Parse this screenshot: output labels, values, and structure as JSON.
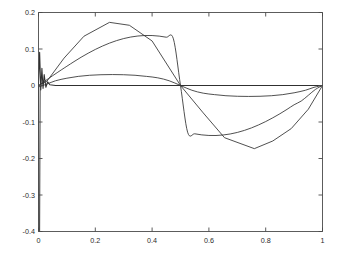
{
  "figure": {
    "background_color": "#ffffff",
    "axes_color": "#4a4a4a",
    "line_color": "#303030"
  },
  "chart_data": {
    "type": "line",
    "title": "",
    "subtitle": "",
    "xlabel": "",
    "ylabel": "",
    "xlim": [
      0,
      1
    ],
    "ylim": [
      -0.4,
      0.2
    ],
    "grid": false,
    "legend": "none",
    "xticks": [
      0,
      0.2,
      0.4,
      0.6,
      0.8,
      1
    ],
    "xtick_labels": [
      "0",
      "0.2",
      "0.4",
      "0.6",
      "0.8",
      "1"
    ],
    "yticks": [
      -0.4,
      -0.3,
      -0.2,
      -0.1,
      0,
      0.1,
      0.2
    ],
    "ytick_labels": [
      "-0.4",
      "-0.3",
      "-0.2",
      "-0.1",
      "0",
      "0.1",
      "0.2"
    ],
    "series": [
      {
        "name": "smooth-sine-large",
        "description": "Smooth large-amplitude sine, peak +0.173 near x=0.25, trough -0.173 near x=0.75, zero crossings at x=0, 0.5, 1",
        "x": [
          0,
          0.02,
          0.05,
          0.08,
          0.1,
          0.125,
          0.15,
          0.175,
          0.2,
          0.225,
          0.25,
          0.275,
          0.3,
          0.325,
          0.35,
          0.375,
          0.4,
          0.425,
          0.45,
          0.475,
          0.5,
          0.525,
          0.55,
          0.575,
          0.6,
          0.625,
          0.65,
          0.675,
          0.7,
          0.725,
          0.75,
          0.775,
          0.8,
          0.825,
          0.85,
          0.875,
          0.9,
          0.925,
          0.95,
          0.975,
          1
        ],
        "y": [
          0,
          0.0108,
          0.0269,
          0.0426,
          0.0528,
          0.0654,
          0.0774,
          0.0885,
          0.0988,
          0.108,
          0.1161,
          0.123,
          0.1286,
          0.1328,
          0.1356,
          0.137,
          0.1369,
          0.1353,
          0.1323,
          0.1279,
          0,
          -0.1279,
          -0.1323,
          -0.1353,
          -0.1369,
          -0.137,
          -0.1356,
          -0.1328,
          -0.1286,
          -0.123,
          -0.1161,
          -0.108,
          -0.0988,
          -0.0885,
          -0.0774,
          -0.0654,
          -0.0528,
          -0.0426,
          -0.0269,
          -0.0108,
          0
        ]
      },
      {
        "name": "piecewise-linear-approx",
        "description": "Piecewise-linear approximation with vertices; max +0.173 near x=0.25, min -0.173 near x=0.76, kinks near x=0.65 and x=0.89",
        "x": [
          0,
          0.03,
          0.09,
          0.16,
          0.25,
          0.32,
          0.4,
          0.5,
          0.58,
          0.655,
          0.76,
          0.825,
          0.89,
          0.95,
          1
        ],
        "y": [
          0,
          0.012,
          0.075,
          0.135,
          0.173,
          0.165,
          0.122,
          0.0,
          -0.075,
          -0.143,
          -0.173,
          -0.152,
          -0.118,
          -0.065,
          0
        ]
      },
      {
        "name": "smooth-sine-small",
        "description": "Small-amplitude smooth sine, peak +0.030 near x=0.27, trough -0.030 near x=0.76, zero crossings at x=0, 0.5, 1",
        "x": [
          0,
          0.03,
          0.06,
          0.1,
          0.14,
          0.18,
          0.22,
          0.26,
          0.3,
          0.34,
          0.38,
          0.42,
          0.46,
          0.5,
          0.54,
          0.58,
          0.62,
          0.66,
          0.7,
          0.74,
          0.78,
          0.82,
          0.86,
          0.9,
          0.94,
          0.97,
          1
        ],
        "y": [
          -0.004,
          0.004,
          0.013,
          0.02,
          0.025,
          0.028,
          0.0295,
          0.03,
          0.0295,
          0.028,
          0.025,
          0.021,
          0.013,
          0.0,
          -0.013,
          -0.021,
          -0.025,
          -0.028,
          -0.0295,
          -0.03,
          -0.0295,
          -0.028,
          -0.025,
          -0.02,
          -0.013,
          -0.005,
          0
        ]
      },
      {
        "name": "near-zero-flat-spiky",
        "description": "Near-zero flat trace along y=0 across the domain with an oscillatory spike region at the left edge",
        "x": [
          0,
          0.004,
          0.008,
          0.012,
          0.016,
          0.02,
          0.026,
          0.032,
          0.04,
          0.06,
          0.1,
          0.2,
          0.3,
          0.4,
          0.5,
          0.6,
          0.7,
          0.8,
          0.9,
          1
        ],
        "y": [
          0,
          0.091,
          -0.012,
          0.047,
          -0.008,
          0.03,
          -0.005,
          0.01,
          0.002,
          0.0,
          0.0,
          0.0,
          0.0,
          0.0,
          0.0,
          0.0,
          0.0,
          0.0,
          0.0,
          0.0
        ]
      },
      {
        "name": "left-edge-vertical-drop",
        "description": "Vertical excursion at x=0 dropping to the axis minimum -0.4",
        "x": [
          0,
          0.002,
          0.004,
          0.006
        ],
        "y": [
          0,
          -0.4,
          -0.4,
          0
        ]
      }
    ]
  }
}
